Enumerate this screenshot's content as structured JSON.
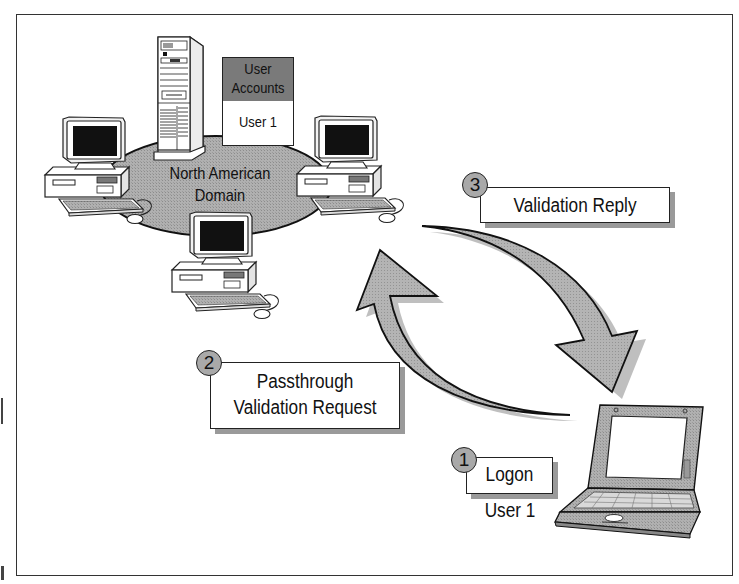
{
  "diagram": {
    "type": "network-authentication-flow",
    "domain": {
      "name_line1": "North American",
      "name_line2": "Domain"
    },
    "user_accounts": {
      "header_line1": "User",
      "header_line2": "Accounts",
      "entry": "User 1"
    },
    "steps": [
      {
        "number": "1",
        "label_line1": "Logon",
        "label_line2": "",
        "sublabel": "User 1"
      },
      {
        "number": "2",
        "label_line1": "Passthrough",
        "label_line2": "Validation Request",
        "sublabel": ""
      },
      {
        "number": "3",
        "label_line1": "Validation Reply",
        "label_line2": "",
        "sublabel": ""
      }
    ],
    "nodes": [
      "domain-controller-server",
      "workstation-left",
      "workstation-right",
      "workstation-bottom",
      "laptop-client"
    ],
    "colors": {
      "domain_fill": "#a8a8a8",
      "arrow_fill": "#a6a6a6",
      "header_fill": "#7a7a7a",
      "outline": "#222222",
      "shadow": "#9a9a9a"
    }
  }
}
